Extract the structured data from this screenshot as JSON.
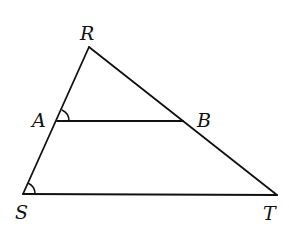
{
  "diagram": {
    "type": "triangle-with-parallel-segment",
    "points": {
      "R": {
        "label": "R",
        "x": 89,
        "y": 47
      },
      "A": {
        "label": "A",
        "x": 57,
        "y": 121
      },
      "B": {
        "label": "B",
        "x": 183,
        "y": 121
      },
      "S": {
        "label": "S",
        "x": 23,
        "y": 194
      },
      "T": {
        "label": "T",
        "x": 277,
        "y": 195
      }
    },
    "segments": [
      "RS",
      "RT",
      "ST",
      "AB"
    ],
    "marked_angles": [
      "RAB",
      "RST"
    ],
    "colors": {
      "stroke": "#111111",
      "background": "#ffffff"
    }
  }
}
